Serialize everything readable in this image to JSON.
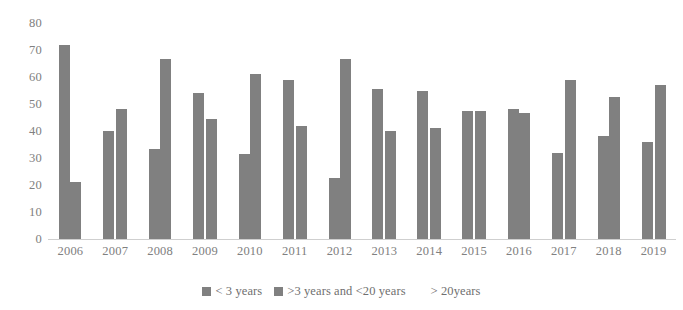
{
  "chart_data": {
    "type": "bar",
    "title": "",
    "subtitle": "",
    "xlabel": "",
    "ylabel": "",
    "categories": [
      "2006",
      "2007",
      "2008",
      "2009",
      "2010",
      "2011",
      "2012",
      "2013",
      "2014",
      "2015",
      "2016",
      "2017",
      "2018",
      "2019"
    ],
    "series": [
      {
        "name": "< 3 years",
        "color": "#808080",
        "values": [
          72,
          40,
          33.5,
          54,
          31.5,
          59,
          22.5,
          55.5,
          55,
          47.5,
          48,
          32,
          38,
          36
        ]
      },
      {
        "name": ">3 years and <20 years",
        "color": "#808080",
        "values": [
          21,
          48,
          66.5,
          44.5,
          61,
          42,
          66.5,
          40,
          41,
          47.5,
          46.5,
          59,
          52.5,
          57
        ]
      },
      {
        "name": "> 20years",
        "color": "#ffffff",
        "values": [
          0,
          0,
          0,
          0,
          0,
          0,
          0,
          0,
          0,
          0,
          0,
          0,
          0,
          0
        ]
      }
    ],
    "ylim": [
      0,
      80
    ],
    "yticks": [
      "80",
      "70",
      "60",
      "50",
      "40",
      "30",
      "20",
      "10",
      "0"
    ],
    "grid": false,
    "legend_position": "bottom"
  },
  "legend": {
    "items": [
      {
        "label": "< 3 years",
        "swatch": "filled"
      },
      {
        "label": ">3 years and <20 years",
        "swatch": "filled"
      },
      {
        "label": "> 20years",
        "swatch": "empty"
      }
    ]
  },
  "colors": {
    "bar": "#808080",
    "text": "#808080",
    "axis": "#cfcfcf",
    "background": "#ffffff"
  }
}
